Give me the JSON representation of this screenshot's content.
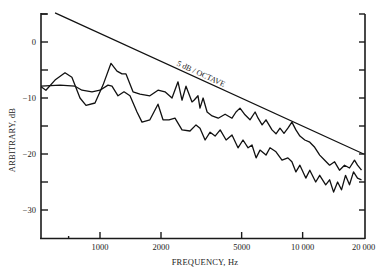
{
  "chart_data": {
    "type": "line",
    "title": "",
    "xlabel": "FREQUENCY, Hz",
    "ylabel": "ARBITRARY, dB",
    "xscale": "log",
    "xlim": [
      512,
      20000
    ],
    "ylim": [
      -35,
      5
    ],
    "grid": false,
    "legend": null,
    "x_ticks": [
      {
        "value": 1000,
        "label": "1000"
      },
      {
        "value": 2000,
        "label": "2000"
      },
      {
        "value": 5000,
        "label": "5000"
      },
      {
        "value": 10000,
        "label": "10 000"
      },
      {
        "value": 20000,
        "label": "20 000"
      }
    ],
    "x_minor_ticks": [
      700
    ],
    "y_ticks": [
      {
        "value": 0,
        "label": "0"
      },
      {
        "value": -10,
        "label": "−10"
      },
      {
        "value": -20,
        "label": "−20"
      },
      {
        "value": -30,
        "label": "−30"
      }
    ],
    "y_minor_ticks": [
      5,
      -5,
      -15,
      -25
    ],
    "right_axis_ticks": [
      5,
      0,
      -5,
      -10,
      -15,
      -20,
      -25,
      -30
    ],
    "annotations": [
      {
        "text": "5 dB / OCTAVE",
        "type": "reference-line",
        "slope_db_per_octave": -5,
        "from": [
          600,
          5.2
        ],
        "to": [
          20000,
          -20
        ]
      }
    ],
    "series": [
      {
        "name": "Spectrum A (upper, peaked)",
        "points": [
          [
            512,
            -8.0
          ],
          [
            541,
            -8.6
          ],
          [
            600,
            -6.8
          ],
          [
            672,
            -5.5
          ],
          [
            727,
            -6.3
          ],
          [
            797,
            -10.0
          ],
          [
            853,
            -11.3
          ],
          [
            945,
            -10.9
          ],
          [
            1035,
            -7.7
          ],
          [
            1133,
            -3.8
          ],
          [
            1213,
            -5.2
          ],
          [
            1284,
            -5.7
          ],
          [
            1344,
            -5.7
          ],
          [
            1455,
            -8.9
          ],
          [
            1576,
            -9.3
          ],
          [
            1764,
            -9.6
          ],
          [
            1933,
            -8.6
          ],
          [
            2093,
            -8.9
          ],
          [
            2266,
            -10.0
          ],
          [
            2427,
            -7.1
          ],
          [
            2540,
            -10.4
          ],
          [
            2658,
            -7.9
          ],
          [
            2846,
            -10.7
          ],
          [
            2911,
            -10.4
          ],
          [
            3046,
            -9.6
          ],
          [
            3116,
            -11.8
          ],
          [
            3226,
            -10.0
          ],
          [
            3377,
            -12.5
          ],
          [
            3574,
            -13.2
          ],
          [
            3830,
            -13.6
          ],
          [
            4143,
            -12.9
          ],
          [
            4482,
            -13.6
          ],
          [
            4690,
            -12.5
          ],
          [
            4906,
            -11.8
          ],
          [
            5195,
            -13.0
          ],
          [
            5500,
            -13.9
          ],
          [
            5825,
            -12.5
          ],
          [
            6027,
            -13.6
          ],
          [
            6306,
            -14.8
          ],
          [
            6597,
            -13.9
          ],
          [
            7061,
            -15.7
          ],
          [
            7388,
            -16.4
          ],
          [
            7730,
            -15.4
          ],
          [
            8087,
            -16.3
          ],
          [
            8459,
            -15.4
          ],
          [
            8852,
            -14.3
          ],
          [
            9261,
            -15.7
          ],
          [
            9689,
            -16.8
          ],
          [
            10250,
            -17.5
          ],
          [
            10845,
            -17.9
          ],
          [
            11475,
            -18.8
          ],
          [
            12140,
            -20.2
          ],
          [
            12850,
            -21.1
          ],
          [
            13590,
            -22.0
          ],
          [
            14380,
            -21.4
          ],
          [
            15210,
            -22.9
          ],
          [
            16100,
            -22.0
          ],
          [
            17040,
            -22.5
          ],
          [
            18020,
            -21.1
          ],
          [
            18660,
            -22.0
          ],
          [
            19530,
            -22.9
          ]
        ]
      },
      {
        "name": "Spectrum B (lower)",
        "points": [
          [
            512,
            -7.9
          ],
          [
            635,
            -7.7
          ],
          [
            753,
            -7.9
          ],
          [
            815,
            -8.6
          ],
          [
            913,
            -8.9
          ],
          [
            1000,
            -8.6
          ],
          [
            1095,
            -7.7
          ],
          [
            1146,
            -7.9
          ],
          [
            1227,
            -9.6
          ],
          [
            1314,
            -8.9
          ],
          [
            1406,
            -9.6
          ],
          [
            1523,
            -12.5
          ],
          [
            1612,
            -14.3
          ],
          [
            1764,
            -13.9
          ],
          [
            1933,
            -11.1
          ],
          [
            2046,
            -13.9
          ],
          [
            2190,
            -13.9
          ],
          [
            2345,
            -13.6
          ],
          [
            2540,
            -15.7
          ],
          [
            2782,
            -15.9
          ],
          [
            2978,
            -14.8
          ],
          [
            3116,
            -15.4
          ],
          [
            3300,
            -17.5
          ],
          [
            3494,
            -16.1
          ],
          [
            3700,
            -16.8
          ],
          [
            3918,
            -15.7
          ],
          [
            4190,
            -17.5
          ],
          [
            4482,
            -16.6
          ],
          [
            4796,
            -18.9
          ],
          [
            5079,
            -17.5
          ],
          [
            5378,
            -18.9
          ],
          [
            5626,
            -18.4
          ],
          [
            5891,
            -20.7
          ],
          [
            6163,
            -19.3
          ],
          [
            6597,
            -20.2
          ],
          [
            6902,
            -18.9
          ],
          [
            7388,
            -19.6
          ],
          [
            7906,
            -21.1
          ],
          [
            8459,
            -20.7
          ],
          [
            8852,
            -21.4
          ],
          [
            9261,
            -23.2
          ],
          [
            9689,
            -22.0
          ],
          [
            10365,
            -24.3
          ],
          [
            10845,
            -22.9
          ],
          [
            11605,
            -25.0
          ],
          [
            12140,
            -23.8
          ],
          [
            12993,
            -25.5
          ],
          [
            13590,
            -24.6
          ],
          [
            14220,
            -26.8
          ],
          [
            14875,
            -25.0
          ],
          [
            15560,
            -26.4
          ],
          [
            16280,
            -23.8
          ],
          [
            17040,
            -25.5
          ],
          [
            17820,
            -23.2
          ],
          [
            18660,
            -24.3
          ],
          [
            19530,
            -24.6
          ]
        ]
      }
    ],
    "colors": {
      "line": "#111111",
      "axis": "#1a1a1a",
      "background": "#ffffff"
    }
  }
}
